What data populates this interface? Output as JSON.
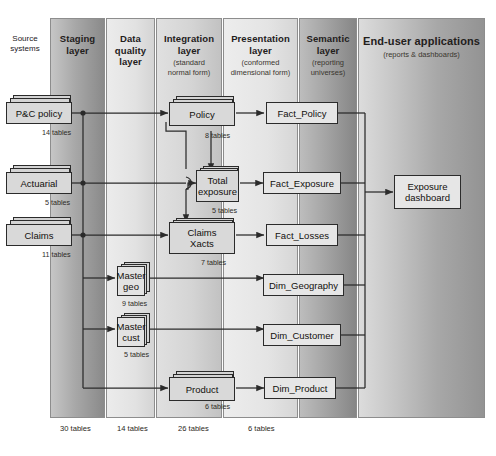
{
  "diagram": {
    "source_systems_label": "Source\nsystems",
    "source_systems_line1": "Source",
    "source_systems_line2": "systems"
  },
  "layers": [
    {
      "id": "staging",
      "title": "Staging layer",
      "title_line1": "Staging",
      "title_line2": "layer",
      "subtitle": "",
      "subtitle_line1": "",
      "subtitle_line2": "",
      "footer_count": "30 tables",
      "x": 50,
      "width": 55,
      "fill_from": "#b9b9b9",
      "fill_to": "#8f8f8f"
    },
    {
      "id": "data-quality",
      "title": "Data quality layer",
      "title_line1": "Data",
      "title_line2": "quality",
      "title_line3": "layer",
      "subtitle": "",
      "footer_count": "14 tables",
      "x": 106,
      "width": 49,
      "fill_from": "#e6e6e6",
      "fill_to": "#d2d2d2"
    },
    {
      "id": "integration",
      "title": "Integration layer",
      "title_line1": "Integration",
      "title_line2": "layer",
      "subtitle": "(standard normal form)",
      "subtitle_line1": "(standard",
      "subtitle_line2": "normal form)",
      "footer_count": "26 tables",
      "x": 156,
      "width": 66,
      "fill_from": "#dcdcdc",
      "fill_to": "#c6c6c6"
    },
    {
      "id": "presentation",
      "title": "Presentation layer",
      "title_line1": "Presentation",
      "title_line2": "layer",
      "subtitle": "(conformed dimensional form)",
      "subtitle_line1": "(conformed",
      "subtitle_line2": "dimensional form)",
      "footer_count": "6 tables",
      "x": 223,
      "width": 75,
      "fill_from": "#e9e9e9",
      "fill_to": "#d8d8d8"
    },
    {
      "id": "semantic",
      "title": "Semantic layer",
      "title_line1": "Semantic",
      "title_line2": "layer",
      "subtitle": "(reporting universes)",
      "subtitle_line1": "(reporting",
      "subtitle_line2": "universes)",
      "footer_count": "",
      "x": 299,
      "width": 58,
      "fill_from": "#b4b4b4",
      "fill_to": "#8c8c8c"
    },
    {
      "id": "end-user",
      "title": "End-user applications",
      "title_line1": "End-user applications",
      "subtitle": "(reports & dashboards)",
      "subtitle_line1": "(reports & dashboards)",
      "footer_count": "",
      "x": 358,
      "width": 127,
      "fill_from": "#d6d6d6",
      "fill_to": "#9a9a9a"
    }
  ],
  "nodes": {
    "sources": [
      {
        "id": "pc-policy",
        "label": "P&C policy",
        "tables": "14 tables"
      },
      {
        "id": "actuarial",
        "label": "Actuarial",
        "tables": "5 tables"
      },
      {
        "id": "claims",
        "label": "Claims",
        "tables": "11 tables"
      }
    ],
    "data_quality": [
      {
        "id": "master-geo",
        "label": "Master\ngeo",
        "label_line1": "Master",
        "label_line2": "geo",
        "tables": "9 tables"
      },
      {
        "id": "master-cust",
        "label": "Master\ncust",
        "label_line1": "Master",
        "label_line2": "cust",
        "tables": "5 tables"
      }
    ],
    "integration": [
      {
        "id": "policy",
        "label": "Policy",
        "label_line1": "Policy",
        "label_line2": "",
        "tables": "8 tables"
      },
      {
        "id": "total-exposure",
        "label": "Total\nexposure",
        "label_line1": "Total",
        "label_line2": "exposure",
        "tables": "5 tables"
      },
      {
        "id": "claims-xacts",
        "label": "Claims\nXacts",
        "label_line1": "Claims",
        "label_line2": "Xacts",
        "tables": "7 tables"
      },
      {
        "id": "product",
        "label": "Product",
        "label_line1": "Product",
        "label_line2": "",
        "tables": "6 tables"
      }
    ],
    "presentation": [
      {
        "id": "fact-policy",
        "label": "Fact_Policy"
      },
      {
        "id": "fact-exposure",
        "label": "Fact_Exposure"
      },
      {
        "id": "fact-losses",
        "label": "Fact_Losses"
      },
      {
        "id": "dim-geography",
        "label": "Dim_Geography"
      },
      {
        "id": "dim-customer",
        "label": "Dim_Customer"
      },
      {
        "id": "dim-product",
        "label": "Dim_Product"
      }
    ],
    "end_user": [
      {
        "id": "exposure-dashboard",
        "label": "Exposure\ndashboard",
        "label_line1": "Exposure",
        "label_line2": "dashboard"
      }
    ]
  },
  "footer_counts": [
    {
      "label": "30 tables"
    },
    {
      "label": "14 tables"
    },
    {
      "label": "26 tables"
    },
    {
      "label": "6 tables"
    }
  ],
  "colors": {
    "line": "#2b2b2b",
    "node_fill": "#d9d9d9",
    "node_border": "#2b2b2b",
    "text": "#12100d",
    "background": "#ffffff"
  }
}
